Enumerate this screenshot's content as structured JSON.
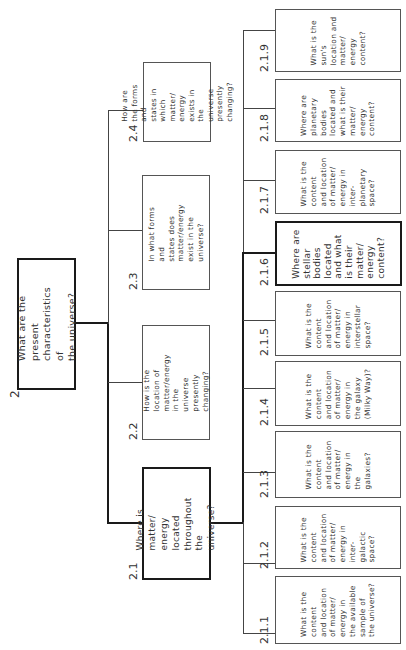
{
  "diagram": {
    "orientation": "rotated 90° counter-clockwise (text reads bottom-to-top)",
    "root": {
      "id": "2.",
      "text": "What are the present\ncharacteristics of\nthe universe?",
      "emphasized": true
    },
    "level2": [
      {
        "id": "2.1",
        "text": "Where is matter/\nenergy located\nthroughout the\nuniverse?",
        "emphasized": true
      },
      {
        "id": "2.2",
        "text": "How is the location of\nmatter/energy in the\nuniverse presently\nchanging?",
        "emphasized": false
      },
      {
        "id": "2.3",
        "text": "In what forms and\nstates does\nmatter/energy\nexist in the universe?",
        "emphasized": false
      },
      {
        "id": "2.4",
        "text": "How are the forms and\nstates in which matter/\nenergy exists in the\nuniverse presently\nchanging?",
        "emphasized": false
      }
    ],
    "level3": [
      {
        "id": "2.1.1",
        "text": "What is the\ncontent\nand location\nof matter/\nenergy in\nthe available\nsample of\nthe universe?",
        "emphasized": false
      },
      {
        "id": "2.1.2",
        "text": "What is the\ncontent\nand location\nof matter/\nenergy in\ninter-\ngalactic\nspace?",
        "emphasized": false
      },
      {
        "id": "2.1.3",
        "text": "What is the\ncontent\nand location\nof matter/\nenergy in\nthe\ngalaxies?",
        "emphasized": false
      },
      {
        "id": "2.1.4",
        "text": "What is the\ncontent\nand location\nof matter/\nenergy in\nthe galaxy\n(Milky Way)?",
        "emphasized": false
      },
      {
        "id": "2.1.5",
        "text": "What is the\ncontent\nand location\nof matter/\nenergy in\ninterstellar\nspace?",
        "emphasized": false
      },
      {
        "id": "2.1.6",
        "text": "Where are\nstellar\nbodies\nlocated\nand what\nis their\nmatter/\nenergy\ncontent?",
        "emphasized": true
      },
      {
        "id": "2.1.7",
        "text": "What is the\ncontent\nand location\nof matter/\nenergy in\ninter-\nplanetary\nspace?",
        "emphasized": false
      },
      {
        "id": "2.1.8",
        "text": "Where are\nplanetary\nbodies\nlocated and\nwhat is their\nmatter/\nenergy\ncontent?",
        "emphasized": false
      },
      {
        "id": "2.1.9",
        "text": "What is the\nsun's\nlocation and\nmatter/\nenergy\ncontent?",
        "emphasized": false
      }
    ]
  }
}
